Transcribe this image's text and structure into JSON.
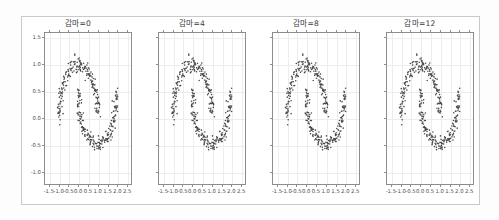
{
  "figure": {
    "background_color": "#ffffff",
    "frame_color": "#c9c9c9",
    "axes_color": "#8d8d8d",
    "point_color": "#4a4a4a",
    "grid_color": "#ededed"
  },
  "panels": [
    {
      "title": "감마=0"
    },
    {
      "title": "감마=4"
    },
    {
      "title": "감마=8"
    },
    {
      "title": "감마=12"
    }
  ],
  "axis": {
    "xticks": [
      "-1.5",
      "-1.0",
      "-0.5",
      "0.0",
      "0.5",
      "1.0",
      "1.5",
      "2.0",
      "2.5"
    ],
    "xtick_values": [
      -1.5,
      -1.0,
      -0.5,
      0.0,
      0.5,
      1.0,
      1.5,
      2.0,
      2.5
    ],
    "yticks": [
      "1.5",
      "1.0",
      "0.5",
      "0.0",
      "-0.5",
      "-1.0"
    ],
    "ytick_values": [
      1.5,
      1.0,
      0.5,
      0.0,
      -0.5,
      -1.0
    ],
    "xlim": [
      -1.75,
      2.75
    ],
    "ylim": [
      -1.25,
      1.6
    ]
  },
  "chart_data": {
    "type": "scatter",
    "title": "",
    "xlabel": "",
    "ylabel": "",
    "xlim": [
      -1.75,
      2.75
    ],
    "ylim": [
      -1.25,
      1.6
    ],
    "grid": true,
    "legend": null,
    "xticks": [
      -1.5,
      -1.0,
      -0.5,
      0.0,
      0.5,
      1.0,
      1.5,
      2.0,
      2.5
    ],
    "yticks": [
      1.5,
      1.0,
      0.5,
      0.0,
      -0.5,
      -1.0
    ],
    "panel_titles": [
      "감마=0",
      "감마=4",
      "감마=8",
      "감마=12"
    ],
    "point_color": "#4a4a4a",
    "marker": "o",
    "marker_size": 1.6,
    "n_points_per_panel": 400,
    "series": [
      {
        "name": "moon-upper",
        "shape": "upper half-circle",
        "center": [
          0.0,
          0.0
        ],
        "radius": 1.0,
        "angle_range_deg": [
          0,
          180
        ],
        "noise_std": 0.07,
        "n_points": 200
      },
      {
        "name": "moon-lower",
        "shape": "lower half-circle shifted",
        "center": [
          1.0,
          0.5
        ],
        "radius": 1.0,
        "angle_range_deg": [
          180,
          360
        ],
        "noise_std": 0.07,
        "n_points": 200
      }
    ]
  }
}
